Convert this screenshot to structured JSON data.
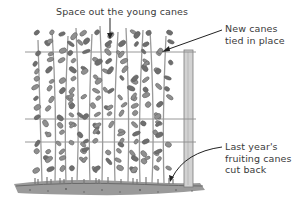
{
  "diagram": {
    "labels": {
      "top": "Space out the young canes",
      "new_canes": [
        "New canes",
        "tied in place"
      ],
      "old_canes": [
        "Last year's",
        "fruiting canes",
        "cut back"
      ]
    },
    "colors": {
      "foliage": "#8a8a8a",
      "foliage_dark": "#5e5e5e",
      "stem": "#9a9a9a",
      "wire": "#8c8c8c",
      "post": "#c8c8c8",
      "post_edge": "#7a7a7a",
      "ground": "#7d7d7d",
      "arrow": "#222222",
      "text": "#3a3a3a"
    },
    "trellis": {
      "post_x": 184,
      "post_width": 9,
      "wire_y": [
        52,
        119,
        142
      ]
    }
  }
}
